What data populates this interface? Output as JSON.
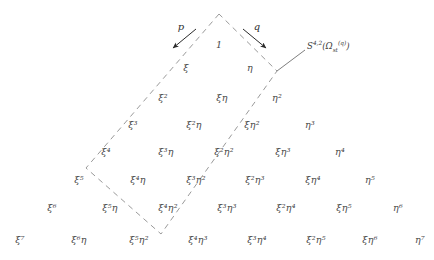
{
  "figure": {
    "type": "lattice-diagram",
    "apex_label": "1",
    "arrow_labels": {
      "left": "p",
      "right": "q"
    },
    "region_annotation": {
      "base": "S",
      "superscript": "4,2",
      "open_paren": "(",
      "omega": "Ω",
      "omega_sub": "st",
      "omega_sup": "(q)",
      "close_paren": ")",
      "full": "S^{4,2}(Ω_{st}^{(q)})"
    },
    "colors": {
      "text": "#4a4a4a",
      "dash": "#9a9a9a",
      "arrow": "#2b2b2b",
      "background": "#ffffff"
    },
    "rows": [
      {
        "degree": 0,
        "cells": [
          {
            "text": "1",
            "xi": 0,
            "eta": 0,
            "x": 219,
            "y": 45
          }
        ]
      },
      {
        "degree": 1,
        "cells": [
          {
            "text": "ξ",
            "xi": 1,
            "eta": 0,
            "x": 186,
            "y": 68
          },
          {
            "text": "η",
            "xi": 0,
            "eta": 1,
            "x": 250,
            "y": 68
          }
        ]
      },
      {
        "degree": 2,
        "cells": [
          {
            "text": "ξ²",
            "xi": 2,
            "eta": 0,
            "x": 163,
            "y": 98
          },
          {
            "text": "ξη",
            "xi": 1,
            "eta": 1,
            "x": 222,
            "y": 98
          },
          {
            "text": "η²",
            "xi": 0,
            "eta": 2,
            "x": 277,
            "y": 98
          }
        ]
      },
      {
        "degree": 3,
        "cells": [
          {
            "text": "ξ³",
            "xi": 3,
            "eta": 0,
            "x": 133,
            "y": 125
          },
          {
            "text": "ξ²η",
            "xi": 2,
            "eta": 1,
            "x": 194,
            "y": 125
          },
          {
            "text": "ξη²",
            "xi": 1,
            "eta": 2,
            "x": 252,
            "y": 125
          },
          {
            "text": "η³",
            "xi": 0,
            "eta": 3,
            "x": 310,
            "y": 125
          }
        ]
      },
      {
        "degree": 4,
        "cells": [
          {
            "text": "ξ⁴",
            "xi": 4,
            "eta": 0,
            "x": 106,
            "y": 152
          },
          {
            "text": "ξ³η",
            "xi": 3,
            "eta": 1,
            "x": 166,
            "y": 152
          },
          {
            "text": "ξ²η²",
            "xi": 2,
            "eta": 2,
            "x": 224,
            "y": 152
          },
          {
            "text": "ξη³",
            "xi": 1,
            "eta": 3,
            "x": 283,
            "y": 152
          },
          {
            "text": "η⁴",
            "xi": 0,
            "eta": 4,
            "x": 340,
            "y": 152
          }
        ]
      },
      {
        "degree": 5,
        "cells": [
          {
            "text": "ξ⁵",
            "xi": 5,
            "eta": 0,
            "x": 79,
            "y": 180
          },
          {
            "text": "ξ⁴η",
            "xi": 4,
            "eta": 1,
            "x": 138,
            "y": 180
          },
          {
            "text": "ξ³η²",
            "xi": 3,
            "eta": 2,
            "x": 196,
            "y": 180
          },
          {
            "text": "ξ²η³",
            "xi": 2,
            "eta": 3,
            "x": 255,
            "y": 180
          },
          {
            "text": "ξη⁴",
            "xi": 1,
            "eta": 4,
            "x": 313,
            "y": 180
          },
          {
            "text": "η⁵",
            "xi": 0,
            "eta": 5,
            "x": 370,
            "y": 180
          }
        ]
      },
      {
        "degree": 6,
        "cells": [
          {
            "text": "ξ⁶",
            "xi": 6,
            "eta": 0,
            "x": 52,
            "y": 208
          },
          {
            "text": "ξ⁵η",
            "xi": 5,
            "eta": 1,
            "x": 110,
            "y": 208
          },
          {
            "text": "ξ⁴η²",
            "xi": 4,
            "eta": 2,
            "x": 168,
            "y": 208
          },
          {
            "text": "ξ³η³",
            "xi": 3,
            "eta": 3,
            "x": 227,
            "y": 208
          },
          {
            "text": "ξ²η⁴",
            "xi": 2,
            "eta": 4,
            "x": 286,
            "y": 208
          },
          {
            "text": "ξη⁵",
            "xi": 1,
            "eta": 5,
            "x": 344,
            "y": 208
          },
          {
            "text": "η⁶",
            "xi": 0,
            "eta": 6,
            "x": 398,
            "y": 208
          }
        ]
      },
      {
        "degree": 7,
        "cells": [
          {
            "text": "ξ⁷",
            "xi": 7,
            "eta": 0,
            "x": 20,
            "y": 240
          },
          {
            "text": "ξ⁶η",
            "xi": 6,
            "eta": 1,
            "x": 79,
            "y": 240
          },
          {
            "text": "ξ⁵η²",
            "xi": 5,
            "eta": 2,
            "x": 139,
            "y": 240
          },
          {
            "text": "ξ⁴η³",
            "xi": 4,
            "eta": 3,
            "x": 198,
            "y": 240
          },
          {
            "text": "ξ³η⁴",
            "xi": 3,
            "eta": 4,
            "x": 257,
            "y": 240
          },
          {
            "text": "ξ²η⁵",
            "xi": 2,
            "eta": 5,
            "x": 316,
            "y": 240
          },
          {
            "text": "ξη⁶",
            "xi": 1,
            "eta": 6,
            "x": 370,
            "y": 240
          },
          {
            "text": "η⁷",
            "xi": 0,
            "eta": 7,
            "x": 420,
            "y": 240
          }
        ]
      }
    ],
    "parallelogram": {
      "apex": {
        "x": 219,
        "y": 14
      },
      "left": {
        "x": 86,
        "y": 168
      },
      "bottom": {
        "x": 161,
        "y": 234
      },
      "right": {
        "x": 277,
        "y": 71
      }
    },
    "arrows": {
      "left": {
        "x1": 196,
        "y1": 29,
        "x2": 173,
        "y2": 48,
        "label_x": 181,
        "label_y": 26
      },
      "right": {
        "x1": 243,
        "y1": 29,
        "x2": 266,
        "y2": 48,
        "label_x": 257,
        "label_y": 26
      }
    },
    "pointer_line": {
      "x1": 277,
      "y1": 71,
      "x2": 305,
      "y2": 50
    },
    "annotation_pos": {
      "x": 307,
      "y": 46
    }
  }
}
